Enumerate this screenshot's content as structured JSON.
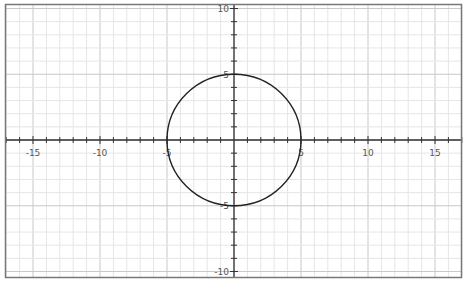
{
  "chart_data": {
    "type": "line",
    "title": "",
    "xlabel": "",
    "ylabel": "",
    "xlim": [
      -17.5,
      17
    ],
    "ylim": [
      -10.3,
      10.3
    ],
    "grid": true,
    "grid_minor_step": 1,
    "grid_major_step": 5,
    "x_ticks": [
      -15,
      -10,
      -5,
      5,
      10,
      15
    ],
    "y_ticks": [
      10,
      5,
      -5,
      -10
    ],
    "x_tick_labels": [
      "-15",
      "-10",
      "-5",
      "5",
      "10",
      "15"
    ],
    "y_tick_labels": [
      "10",
      "5",
      "-5",
      "-10"
    ],
    "series": [
      {
        "name": "circle",
        "equation": "x^2 + y^2 = 25",
        "center": [
          0,
          0
        ],
        "radius": 5,
        "color": "#222222"
      }
    ],
    "legend": null
  },
  "colors": {
    "background": "#ffffff",
    "minor_grid": "#e6e6e6",
    "major_grid": "#c8c8c8",
    "axis": "#333333",
    "frame": "#777777",
    "curve": "#222222",
    "label": "#555555"
  }
}
